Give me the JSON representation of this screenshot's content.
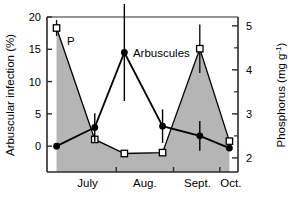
{
  "chart_data": {
    "type": "line",
    "title": "",
    "xlabel": "",
    "ylabel": "Arbuscular infection (%)",
    "y2label": "Phosphorus (mg g⁻¹)",
    "grid": false,
    "legend": "inline-annotation",
    "x_tick_labels": [
      "July",
      "Aug.",
      "Sept.",
      "Oct."
    ],
    "x_tick_positions": [
      0.85,
      2.05,
      3.15,
      3.85
    ],
    "xlim": [
      0,
      4
    ],
    "ylim": [
      -4,
      20
    ],
    "y_ticks": [
      0,
      5,
      10,
      15,
      20
    ],
    "y2lim": [
      1.68,
      5.2
    ],
    "y2_ticks": [
      2,
      3,
      4,
      5
    ],
    "series": [
      {
        "name": "Arbuscules",
        "axis": "left",
        "marker": "filled-circle",
        "color": "#000000",
        "x": [
          0.2,
          1.0,
          1.62,
          2.42,
          3.2,
          3.82
        ],
        "values": [
          0.0,
          2.9,
          14.5,
          3.1,
          1.6,
          -0.3
        ],
        "errors": [
          0.0,
          2.2,
          7.5,
          2.6,
          2.3,
          0.0
        ]
      },
      {
        "name": "P",
        "axis": "right",
        "marker": "open-square",
        "color": "#000000",
        "fill": "#b5b5b5",
        "x": [
          0.2,
          1.0,
          1.62,
          2.42,
          3.2,
          3.82
        ],
        "values": [
          4.95,
          2.42,
          2.1,
          2.12,
          4.48,
          2.38
        ],
        "errors": [
          0.18,
          0.0,
          0.0,
          0.0,
          0.55,
          0.0
        ]
      }
    ],
    "annotations": [
      {
        "text": "P",
        "x": 0.42,
        "y": 15.6
      },
      {
        "text": "Arbuscules",
        "x": 1.8,
        "y": 14.5
      }
    ]
  },
  "axes": {
    "left_title": "Arbuscular infection (%)",
    "right_title": "Phosphorus (mg g⁻¹)",
    "left_ticks": [
      "0",
      "5",
      "10",
      "15",
      "20"
    ],
    "right_ticks": [
      "2",
      "3",
      "4",
      "5"
    ],
    "category_labels": [
      "July",
      "Aug.",
      "Sept.",
      "Oct."
    ]
  },
  "labels": {
    "p_label": "P",
    "arbuscules_label": "Arbuscules"
  }
}
